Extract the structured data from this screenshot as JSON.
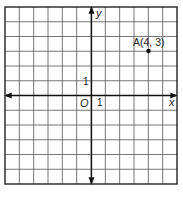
{
  "diagram": {
    "type": "coordinate-plane",
    "grid": {
      "columns": 12,
      "rows": 12,
      "x_range": [
        -6,
        6
      ],
      "y_range": [
        -6,
        6
      ]
    },
    "axes": {
      "x_label": "x",
      "y_label": "y",
      "origin_label": "O",
      "x_unit_label": "1",
      "y_unit_label": "1"
    },
    "points": [
      {
        "name": "A",
        "x": 4,
        "y": 3,
        "label": "A(4, 3)"
      }
    ]
  },
  "chart_data": {
    "type": "scatter",
    "title": "",
    "xlabel": "x",
    "ylabel": "y",
    "xlim": [
      -6,
      6
    ],
    "ylim": [
      -6,
      6
    ],
    "grid": true,
    "series": [
      {
        "name": "A",
        "x": [
          4
        ],
        "y": [
          3
        ],
        "labels": [
          "A(4, 3)"
        ]
      }
    ]
  }
}
